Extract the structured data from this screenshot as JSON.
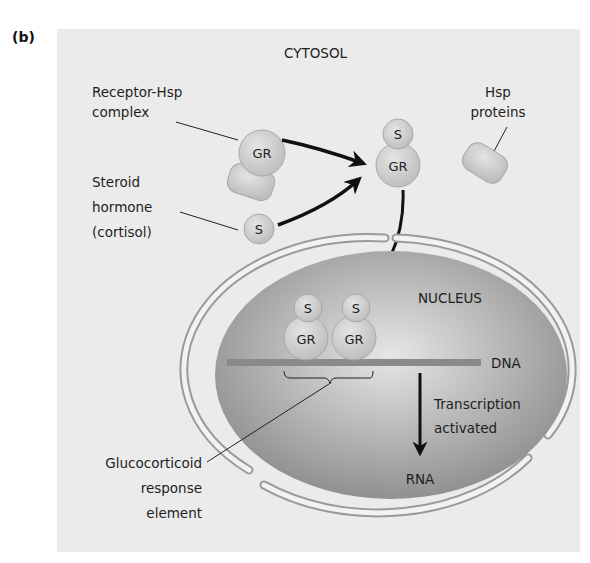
{
  "panel_label": "(b)",
  "compartments": {
    "cytosol": "CYTOSOL",
    "nucleus": "NUCLEUS"
  },
  "labels": {
    "receptor_hsp": [
      "Receptor-Hsp",
      "complex"
    ],
    "steroid": [
      "Steroid",
      "hormone",
      "(cortisol)"
    ],
    "hsp_proteins": [
      "Hsp",
      "proteins"
    ],
    "dna": "DNA",
    "transcription": [
      "Transcription",
      "activated"
    ],
    "rna": "RNA",
    "gre": [
      "Glucocorticoid",
      "response",
      "element"
    ]
  },
  "molecules": {
    "receptor": "GR",
    "steroid": "S"
  },
  "colors": {
    "panel_bg": "#ebebeb",
    "nucleus_dark": "#8e8e8e",
    "nucleus_light": "#e2e2e2",
    "membrane": "#9a9a9a",
    "molecule_fill": "#d2d2d2",
    "dna": "#8a8a8a",
    "arrow": "#111111"
  }
}
